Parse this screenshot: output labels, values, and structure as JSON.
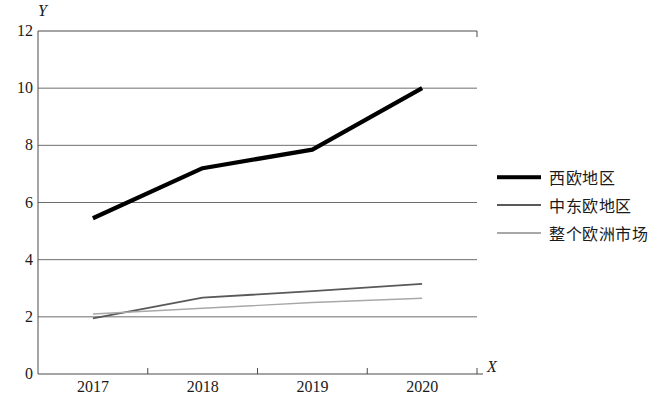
{
  "chart_data": {
    "type": "line",
    "title": "",
    "xlabel": "X",
    "ylabel": "Y",
    "categories": [
      "2017",
      "2018",
      "2019",
      "2020"
    ],
    "yticks": [
      0,
      2,
      4,
      6,
      8,
      10,
      12
    ],
    "ylim": [
      0,
      12
    ],
    "grid": true,
    "legend_position": "right",
    "series": [
      {
        "name": "西欧地区",
        "values": [
          5.45,
          7.2,
          7.85,
          10.0
        ],
        "color": "#000000",
        "width": 4.2
      },
      {
        "name": "中东欧地区",
        "values": [
          1.95,
          2.67,
          2.9,
          3.15
        ],
        "color": "#59595b",
        "width": 1.8
      },
      {
        "name": "整个欧洲市场",
        "values": [
          2.1,
          2.3,
          2.5,
          2.65
        ],
        "color": "#a8a8aa",
        "width": 1.4
      }
    ]
  },
  "axes": {
    "y_axis_label": "Y",
    "x_axis_label": "X",
    "y_tick_labels": [
      "12",
      "10",
      "8",
      "6",
      "4",
      "2",
      "0"
    ],
    "x_tick_labels": [
      "2017",
      "2018",
      "2019",
      "2020"
    ]
  },
  "legend": {
    "items": [
      {
        "label": "西欧地区"
      },
      {
        "label": "中东欧地区"
      },
      {
        "label": "整个欧洲市场"
      }
    ]
  },
  "colors": {
    "axis": "#4a4a4c",
    "grid": "#6e6e70",
    "series_1": "#000000",
    "series_2": "#59595b",
    "series_3": "#a8a8aa",
    "background": "#ffffff"
  }
}
